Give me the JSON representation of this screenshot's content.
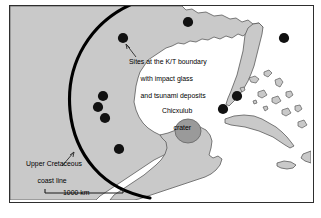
{
  "figure": {
    "background_color": "#ffffff",
    "frame_color": "#2e2e2e"
  },
  "map": {
    "land_fill": "#c9c9c9",
    "land_outline": "#5a5a5a",
    "sea_fill": "#ffffff",
    "site_dot_color": "#111111",
    "crater_fill": "#9a9a9a",
    "crater_outline": "#6b6b6b",
    "kt_coastline_color": "#000000",
    "leader_color": "#3a3a3a"
  },
  "labels": {
    "sites": "Sites at the K/T boundary\nwith impact glass\nand tsunami deposits",
    "sites_line_1": "Sites at the K/T boundary",
    "sites_line_2": "with impact glass",
    "sites_line_3": "and tsunami deposits",
    "crater": "Chicxulub\ncrater",
    "crater_line_1": "Chicxulub",
    "crater_line_2": "crater",
    "coastline": "Upper Cretaceous\ncoast line",
    "coastline_line_1": "Upper Cretaceous",
    "coastline_line_2": "coast line"
  },
  "scale_bar": {
    "label": "1000 km",
    "length_px": 78
  },
  "sites": [
    {
      "id": "site-north-gulf-1",
      "x": 113,
      "y": 32,
      "r": 5.1
    },
    {
      "id": "site-north-gulf-2",
      "x": 178,
      "y": 16,
      "r": 5.1
    },
    {
      "id": "site-atlantic-ne",
      "x": 274,
      "y": 32,
      "r": 5.1
    },
    {
      "id": "site-mexico-1",
      "x": 93,
      "y": 90,
      "r": 5.1
    },
    {
      "id": "site-mexico-2",
      "x": 88,
      "y": 101,
      "r": 5.1
    },
    {
      "id": "site-mexico-3",
      "x": 95,
      "y": 112,
      "r": 5.1
    },
    {
      "id": "site-mexico-4",
      "x": 109,
      "y": 143,
      "r": 5.1
    },
    {
      "id": "site-florida-w",
      "x": 227,
      "y": 90,
      "r": 5.1
    },
    {
      "id": "site-cuba-nw",
      "x": 213,
      "y": 103,
      "r": 5.1
    }
  ],
  "crater": {
    "cx": 178,
    "cy": 125,
    "rx": 13,
    "ry": 12
  }
}
